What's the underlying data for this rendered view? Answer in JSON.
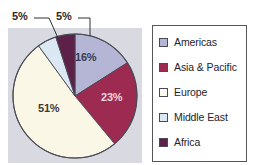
{
  "chart_data": {
    "type": "pie",
    "title": "",
    "categories": [
      "Americas",
      "Asia & Pacific",
      "Europe",
      "Middle East",
      "Africa"
    ],
    "values": [
      16,
      23,
      51,
      5,
      5
    ],
    "value_labels": [
      "16%",
      "23%",
      "51%",
      "5%",
      "5%"
    ],
    "unit": "%",
    "colors": [
      "#b5b5d6",
      "#9d2a50",
      "#faf7e6",
      "#dbe7f3",
      "#5d2049"
    ],
    "legend_position": "right",
    "grid": false,
    "start_angle_deg": 0,
    "direction": "clockwise",
    "labels_outside": [
      "Middle East",
      "Africa"
    ],
    "labels_inside": [
      "Americas",
      "Asia & Pacific",
      "Europe"
    ]
  },
  "pie": {
    "slices": [
      {
        "name": "Americas",
        "label": "16%",
        "value": 16,
        "color": "#b5b5d6",
        "label_color": "#3a3a4a"
      },
      {
        "name": "Asia & Pacific",
        "label": "23%",
        "value": 23,
        "color": "#9d2a50",
        "label_color": "#efd7e0"
      },
      {
        "name": "Europe",
        "label": "51%",
        "value": 51,
        "color": "#faf7e6",
        "label_color": "#3a3a3a"
      },
      {
        "name": "Middle East",
        "label": "5%",
        "value": 5,
        "color": "#dbe7f3",
        "label_color": "#2a2a2a"
      },
      {
        "name": "Africa",
        "label": "5%",
        "value": 5,
        "color": "#5d2049",
        "label_color": "#2a2a2a"
      }
    ],
    "callouts": [
      {
        "name": "Middle East",
        "label": "5%"
      },
      {
        "name": "Africa",
        "label": "5%"
      }
    ],
    "panel_color": "#d9d9e2",
    "outline_color": "#4a4a55"
  },
  "legend": {
    "items": [
      {
        "label": "Americas",
        "color": "#b5b5d6"
      },
      {
        "label": "Asia & Pacific",
        "color": "#9d2a50"
      },
      {
        "label": "Europe",
        "color": "#fbfaf0"
      },
      {
        "label": "Middle East",
        "color": "#dbe7f3"
      },
      {
        "label": "Africa",
        "color": "#5d2049"
      }
    ],
    "border_color": "#55555f",
    "background": "#ffffff"
  }
}
